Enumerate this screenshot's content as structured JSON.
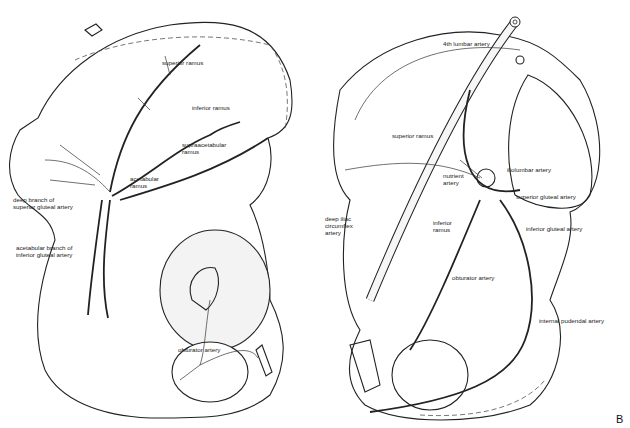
{
  "figure": {
    "letter": "B",
    "panels": [
      {
        "name": "left",
        "labels": [
          "superior ramus",
          "inferior ramus",
          "supraacetabular\nramus",
          "acetabular\nramus",
          "deep branch of\nsuperior gluteal artery",
          "acetabular branch of\ninferior gluteal artery",
          "obturator artery"
        ]
      },
      {
        "name": "right",
        "labels": [
          "4th lumbar artery",
          "superior ramus",
          "nutrient\nartery",
          "iliolumbar artery",
          "superior gluteal artery",
          "deep iliac\ncircumflex\nartery",
          "inferior\nramus",
          "inferior gluteal artery",
          "obturator artery",
          "internal pudendal artery"
        ]
      }
    ]
  }
}
